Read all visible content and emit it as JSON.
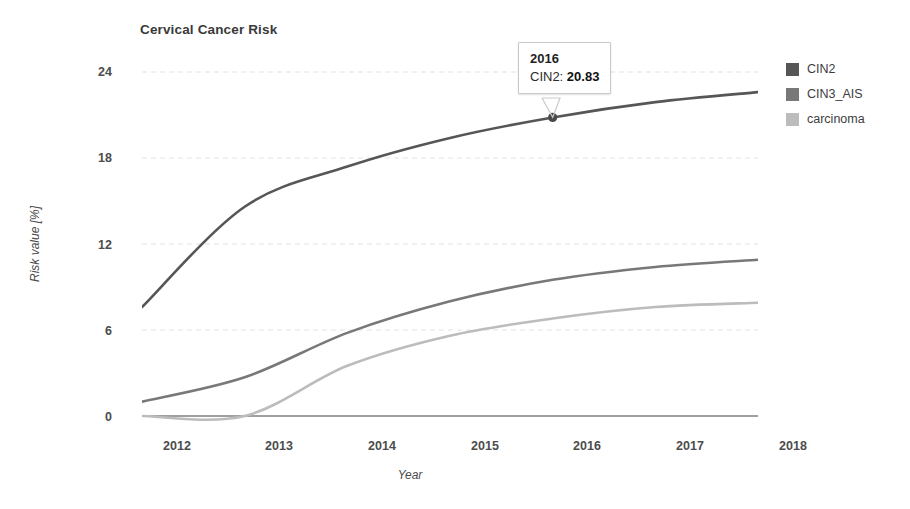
{
  "chart_data": {
    "type": "line",
    "title": "Cervical Cancer Risk",
    "xlabel": "Year",
    "ylabel": "Risk value [%]",
    "categories": [
      "2012",
      "2013",
      "2014",
      "2015",
      "2016",
      "2017",
      "2018"
    ],
    "x": [
      2012,
      2013,
      2014,
      2015,
      2016,
      2017,
      2018
    ],
    "xlim": [
      2012,
      2018
    ],
    "ylim": [
      0,
      24
    ],
    "yticks": [
      "24",
      "18",
      "12",
      "6",
      "0"
    ],
    "ytick_values": [
      24,
      18,
      12,
      6,
      0
    ],
    "grid": "horizontal-dashed",
    "legend_position": "right",
    "series": [
      {
        "name": "CIN2",
        "color": "#565656",
        "values": [
          7.6,
          14.6,
          17.4,
          19.4,
          20.83,
          21.9,
          22.6
        ]
      },
      {
        "name": "CIN3_AIS",
        "color": "#787878",
        "values": [
          1.0,
          2.7,
          5.8,
          8.0,
          9.5,
          10.4,
          10.9
        ]
      },
      {
        "name": "carcinoma",
        "color": "#bcbcbc",
        "values": [
          0.0,
          0.0,
          3.5,
          5.6,
          6.8,
          7.6,
          7.9
        ]
      }
    ],
    "annotation": {
      "series": "CIN2",
      "year": "2016",
      "label": "CIN2:",
      "value": "20.83",
      "point_x": 2016,
      "point_y": 20.83
    }
  },
  "legend": {
    "items": [
      {
        "label": "CIN2",
        "color": "#565656"
      },
      {
        "label": "CIN3_AIS",
        "color": "#787878"
      },
      {
        "label": "carcinoma",
        "color": "#bcbcbc"
      }
    ]
  },
  "tooltip": {
    "title": "2016",
    "series_label": "CIN2:",
    "value": "20.83"
  }
}
